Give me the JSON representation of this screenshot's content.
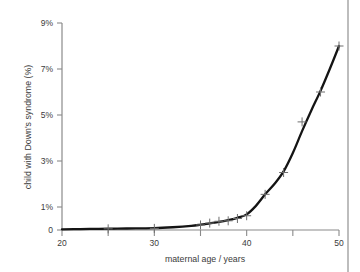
{
  "figure": {
    "title": "",
    "border_color": "#9a9a9a",
    "axis_color": "#8a8a8a",
    "curve_color": "#141414",
    "marker_color": "#6e6e6e"
  },
  "chart_data": {
    "type": "line",
    "title": "",
    "xlabel": "maternal age / years",
    "ylabel": "child with Down's syndrome (%)",
    "xlim": [
      20,
      50
    ],
    "ylim": [
      0,
      9
    ],
    "grid": false,
    "legend": "none",
    "x_ticks": [
      20,
      25,
      30,
      35,
      40,
      45,
      50
    ],
    "x_tick_labels": [
      "20",
      "",
      "30",
      "",
      "40",
      "",
      "50"
    ],
    "y_ticks": [
      0,
      1,
      3,
      5,
      7,
      9
    ],
    "y_tick_labels": [
      "0",
      "1%",
      "3%",
      "5%",
      "7%",
      "9%"
    ],
    "series": [
      {
        "name": "child with Down's syndrome (%)",
        "marker": "plus",
        "x": [
          25,
          30,
          35,
          36,
          37,
          38,
          39,
          40,
          42,
          44,
          46,
          48,
          50
        ],
        "values": [
          0.05,
          0.07,
          0.22,
          0.3,
          0.38,
          0.4,
          0.5,
          0.62,
          1.55,
          2.5,
          4.7,
          6.0,
          8.0
        ]
      }
    ],
    "curve_x": [
      20,
      22,
      24,
      26,
      28,
      30,
      32,
      34,
      35,
      36,
      37,
      38,
      39,
      40,
      41,
      42,
      43,
      44,
      45,
      46,
      47,
      48,
      49,
      50
    ],
    "curve_y": [
      0.03,
      0.04,
      0.05,
      0.06,
      0.07,
      0.08,
      0.12,
      0.18,
      0.23,
      0.29,
      0.35,
      0.43,
      0.53,
      0.68,
      1.05,
      1.55,
      2.0,
      2.55,
      3.35,
      4.3,
      5.2,
      6.05,
      7.0,
      8.0
    ]
  }
}
